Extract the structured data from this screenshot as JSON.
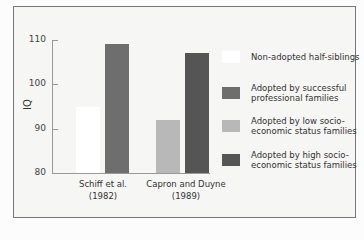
{
  "chart_data": {
    "type": "bar",
    "title": "",
    "xlabel": "",
    "ylabel": "IQ",
    "ylim": [
      80,
      110
    ],
    "yticks": [
      80,
      90,
      100,
      110
    ],
    "grid": false,
    "legend_position": "right",
    "categories": [
      "Schiff et al. (1982)",
      "Capron and Duyne (1989)"
    ],
    "category_lines": [
      [
        "Schiff et al.",
        "(1982)"
      ],
      [
        "Capron and Duyne",
        "(1989)"
      ]
    ],
    "series": [
      {
        "name": "Non-adopted half-siblings",
        "color": "#ffffff",
        "values": [
          95,
          null
        ]
      },
      {
        "name": "Adopted by successful professional families",
        "color": "#6e6e6e",
        "values": [
          109,
          null
        ]
      },
      {
        "name": "Adopted by low socio-economic status families",
        "color": "#b8b8b8",
        "values": [
          null,
          92
        ]
      },
      {
        "name": "Adopted by high socio-economic status families",
        "color": "#555555",
        "values": [
          null,
          107
        ]
      }
    ]
  },
  "axis": {
    "ylabel": "IQ",
    "ticks": [
      "110",
      "100",
      "90",
      "80"
    ]
  },
  "legend": [
    {
      "label": "Non-adopted half-siblings",
      "color": "#ffffff"
    },
    {
      "label": "Adopted by successful professional families",
      "color": "#6e6e6e"
    },
    {
      "label": "Adopted by low socio-economic status families",
      "color": "#b8b8b8"
    },
    {
      "label": "Adopted by high socio-economic status families",
      "color": "#555555"
    }
  ],
  "labels": {
    "cat1_line1": "Schiff et al.",
    "cat1_line2": "(1982)",
    "cat2_line1": "Capron and Duyne",
    "cat2_line2": "(1989)"
  }
}
